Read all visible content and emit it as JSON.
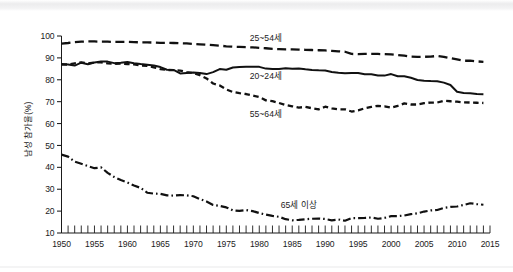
{
  "figure": {
    "background_color": "#ffffff",
    "line_color": "#111111"
  },
  "chart_data": {
    "type": "line",
    "title": "",
    "subtitle": "",
    "xlabel": "",
    "ylabel": "남성 참가율(%)",
    "xlim": [
      1950,
      2015
    ],
    "ylim": [
      10,
      100
    ],
    "grid": false,
    "legend_position": "inline-annotations",
    "x_ticks": [
      1950,
      1955,
      1960,
      1965,
      1970,
      1975,
      1980,
      1985,
      1990,
      1995,
      2000,
      2005,
      2010,
      2015
    ],
    "x_tick_labels": [
      "1950",
      "1955",
      "1960",
      "1965",
      "1970",
      "1975",
      "1980",
      "1985",
      "1990",
      "1995",
      "2000",
      "2005",
      "2010",
      "2015"
    ],
    "x_minor_tick_interval": 1,
    "y_ticks": [
      10,
      20,
      30,
      40,
      50,
      60,
      70,
      80,
      90,
      100
    ],
    "y_tick_labels": [
      "10",
      "20",
      "30",
      "40",
      "50",
      "60",
      "70",
      "80",
      "90",
      "100"
    ],
    "series": [
      {
        "name": "25~54세",
        "line_style": "long-dash",
        "label_x": 1981,
        "label_y": 97.5,
        "x": [
          1950,
          1951,
          1952,
          1953,
          1954,
          1955,
          1956,
          1957,
          1958,
          1959,
          1960,
          1961,
          1962,
          1963,
          1964,
          1965,
          1966,
          1967,
          1968,
          1969,
          1970,
          1971,
          1972,
          1973,
          1974,
          1975,
          1976,
          1977,
          1978,
          1979,
          1980,
          1981,
          1982,
          1983,
          1984,
          1985,
          1986,
          1987,
          1988,
          1989,
          1990,
          1991,
          1992,
          1993,
          1994,
          1995,
          1996,
          1997,
          1998,
          1999,
          2000,
          2001,
          2002,
          2003,
          2004,
          2005,
          2006,
          2007,
          2008,
          2009,
          2010,
          2011,
          2012,
          2013,
          2014
        ],
        "y": [
          96.5,
          96.8,
          97.2,
          97.4,
          97.5,
          97.5,
          97.4,
          97.4,
          97.3,
          97.3,
          97.3,
          97.2,
          97.1,
          97.1,
          97.0,
          96.9,
          96.9,
          96.8,
          96.7,
          96.6,
          96.4,
          96.2,
          96.0,
          95.8,
          95.6,
          95.3,
          95.1,
          95.0,
          94.9,
          94.8,
          94.6,
          94.4,
          94.1,
          94.0,
          93.9,
          93.9,
          93.8,
          93.7,
          93.6,
          93.5,
          93.4,
          93.2,
          93.0,
          92.8,
          91.8,
          91.7,
          91.8,
          91.8,
          91.8,
          91.7,
          91.6,
          91.3,
          91.0,
          90.6,
          90.5,
          90.5,
          90.6,
          90.9,
          90.5,
          89.9,
          89.3,
          88.7,
          88.7,
          88.4,
          88.2
        ]
      },
      {
        "name": "20~24세",
        "line_style": "solid",
        "label_x": 1981,
        "label_y": 80.5,
        "x": [
          1950,
          1951,
          1952,
          1953,
          1954,
          1955,
          1956,
          1957,
          1958,
          1959,
          1960,
          1961,
          1962,
          1963,
          1964,
          1965,
          1966,
          1967,
          1968,
          1969,
          1970,
          1971,
          1972,
          1973,
          1974,
          1975,
          1976,
          1977,
          1978,
          1979,
          1980,
          1981,
          1982,
          1983,
          1984,
          1985,
          1986,
          1987,
          1988,
          1989,
          1990,
          1991,
          1992,
          1993,
          1994,
          1995,
          1996,
          1997,
          1998,
          1999,
          2000,
          2001,
          2002,
          2003,
          2004,
          2005,
          2006,
          2007,
          2008,
          2009,
          2010,
          2011,
          2012,
          2013,
          2014
        ],
        "y": [
          87.2,
          87.0,
          86.5,
          87.8,
          87.1,
          87.9,
          88.4,
          88.3,
          87.6,
          87.8,
          88.1,
          87.6,
          87.2,
          86.9,
          86.5,
          85.8,
          84.6,
          84.5,
          82.9,
          83.1,
          83.3,
          83.1,
          82.6,
          83.5,
          84.9,
          84.6,
          85.6,
          85.8,
          86.0,
          86.0,
          85.9,
          85.1,
          84.9,
          84.9,
          85.3,
          85.0,
          85.2,
          84.8,
          84.5,
          84.3,
          84.2,
          83.6,
          83.2,
          83.0,
          83.1,
          83.1,
          82.5,
          82.5,
          82.0,
          81.9,
          82.6,
          81.6,
          81.6,
          80.9,
          79.9,
          79.6,
          79.4,
          79.3,
          78.7,
          77.6,
          74.5,
          74.0,
          73.8,
          73.5,
          73.4
        ]
      },
      {
        "name": "55~64세",
        "line_style": "short-dash",
        "label_x": 1981,
        "label_y": 63.0,
        "x": [
          1950,
          1951,
          1952,
          1953,
          1954,
          1955,
          1956,
          1957,
          1958,
          1959,
          1960,
          1961,
          1962,
          1963,
          1964,
          1965,
          1966,
          1967,
          1968,
          1969,
          1970,
          1971,
          1972,
          1973,
          1974,
          1975,
          1976,
          1977,
          1978,
          1979,
          1980,
          1981,
          1982,
          1983,
          1984,
          1985,
          1986,
          1987,
          1988,
          1989,
          1990,
          1991,
          1992,
          1993,
          1994,
          1995,
          1996,
          1997,
          1998,
          1999,
          2000,
          2001,
          2002,
          2003,
          2004,
          2005,
          2006,
          2007,
          2008,
          2009,
          2010,
          2011,
          2012,
          2013,
          2014
        ],
        "y": [
          86.9,
          87.0,
          87.5,
          87.9,
          87.5,
          87.9,
          88.0,
          87.5,
          87.3,
          87.4,
          87.2,
          87.0,
          86.5,
          86.4,
          85.7,
          84.9,
          84.5,
          84.4,
          84.2,
          83.5,
          83.0,
          82.1,
          80.6,
          78.3,
          77.4,
          75.6,
          74.4,
          73.9,
          73.5,
          72.8,
          72.1,
          70.6,
          70.2,
          69.4,
          68.5,
          67.9,
          67.3,
          67.6,
          67.0,
          66.5,
          67.7,
          66.9,
          66.5,
          66.5,
          65.5,
          66.0,
          67.0,
          67.6,
          68.1,
          67.9,
          67.3,
          68.1,
          69.2,
          68.7,
          68.7,
          69.3,
          69.6,
          69.6,
          70.4,
          70.2,
          70.0,
          69.7,
          69.6,
          69.5,
          69.4
        ]
      },
      {
        "name": "65세 이상",
        "line_style": "dash-dot",
        "label_x": 1986,
        "label_y": 21.5,
        "x": [
          1950,
          1951,
          1952,
          1953,
          1954,
          1955,
          1956,
          1957,
          1958,
          1959,
          1960,
          1961,
          1962,
          1963,
          1964,
          1965,
          1966,
          1967,
          1968,
          1969,
          1970,
          1971,
          1972,
          1973,
          1974,
          1975,
          1976,
          1977,
          1978,
          1979,
          1980,
          1981,
          1982,
          1983,
          1984,
          1985,
          1986,
          1987,
          1988,
          1989,
          1990,
          1991,
          1992,
          1993,
          1994,
          1995,
          1996,
          1997,
          1998,
          1999,
          2000,
          2001,
          2002,
          2003,
          2004,
          2005,
          2006,
          2007,
          2008,
          2009,
          2010,
          2011,
          2012,
          2013,
          2014
        ],
        "y": [
          45.8,
          44.9,
          42.6,
          41.6,
          40.6,
          39.6,
          40.0,
          37.5,
          35.6,
          34.2,
          33.1,
          31.7,
          30.6,
          28.4,
          28.0,
          27.9,
          27.2,
          27.1,
          27.3,
          27.2,
          26.8,
          25.5,
          24.4,
          22.8,
          22.4,
          21.7,
          20.3,
          20.1,
          20.5,
          20.0,
          19.1,
          18.4,
          17.8,
          17.4,
          16.3,
          15.8,
          16.0,
          16.3,
          16.5,
          16.6,
          16.4,
          15.8,
          16.2,
          15.6,
          16.8,
          16.8,
          16.9,
          17.1,
          16.5,
          16.9,
          17.7,
          17.7,
          18.0,
          18.6,
          19.0,
          19.8,
          20.3,
          20.5,
          21.5,
          21.9,
          22.1,
          22.8,
          23.6,
          23.2,
          22.9
        ]
      }
    ]
  }
}
